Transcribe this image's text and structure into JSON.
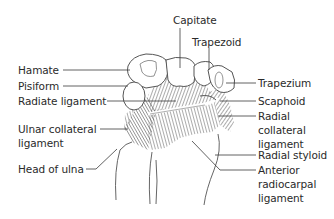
{
  "diagram": {
    "labels": {
      "capitate": "Capitate",
      "trapezoid": "Trapezoid",
      "hamate": "Hamate",
      "trapezium": "Trapezium",
      "pisiform": "Pisiform",
      "radiate_ligament": "Radiate ligament",
      "scaphoid": "Scaphoid",
      "ulnar_collateral_1": "Ulnar collateral",
      "ulnar_collateral_2": "ligament",
      "radial_collateral_1": "Radial",
      "radial_collateral_2": "collateral",
      "radial_collateral_3": "ligament",
      "head_of_ulna": "Head of ulna",
      "radial_styloid": "Radial styloid",
      "anterior_radiocarpal_1": "Anterior",
      "anterior_radiocarpal_2": "radiocarpal",
      "anterior_radiocarpal_3": "ligament"
    },
    "colors": {
      "outline": "#555555",
      "leader": "#3a3a3a",
      "text": "#2a2a2a",
      "hatch": "#6a6a6a"
    }
  }
}
